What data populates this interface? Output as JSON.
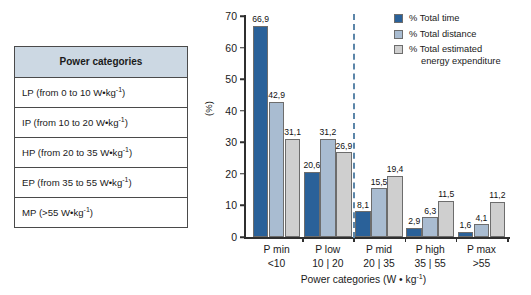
{
  "table": {
    "header": "Power categories",
    "rows": [
      {
        "label": "LP (from 0 to 10 W•kg",
        "sup": "-1",
        "tail": ")"
      },
      {
        "label": "IP (from 10 to 20 W•kg",
        "sup": "-1",
        "tail": ")"
      },
      {
        "label": "HP (from 20 to 35 W•kg",
        "sup": "-1",
        "tail": ")"
      },
      {
        "label": "EP (from 35 to 55 W•kg",
        "sup": "-1",
        "tail": ")"
      },
      {
        "label": "MP (>55 W•kg",
        "sup": "-1",
        "tail": ")"
      }
    ]
  },
  "legend": {
    "items": [
      {
        "label": "% Total time",
        "label2": "",
        "color": "#2a6199"
      },
      {
        "label": "% Total distance",
        "label2": "",
        "color": "#a9bcd1"
      },
      {
        "label": "% Total estimated",
        "label2": "energy expenditure",
        "color": "#cfcfcf"
      }
    ]
  },
  "chart_data": {
    "type": "bar",
    "title": "",
    "xlabel": "Power categories (W • kg",
    "xlabel_sup": "-1",
    "xlabel_tail": ")",
    "ylabel": "(%)",
    "ylim": [
      0,
      70
    ],
    "yticks": [
      0,
      10,
      20,
      30,
      40,
      50,
      60,
      70
    ],
    "ytick_labels": [
      "0",
      "10",
      "20",
      "30",
      "40",
      "50",
      "60",
      "70"
    ],
    "grid": false,
    "legend_position": "top-right",
    "categories": [
      "P min",
      "P low",
      "P mid",
      "P high",
      "P max"
    ],
    "category_sublabels": [
      "<10",
      "10 | 20",
      "20 | 35",
      "35 | 55",
      ">55"
    ],
    "series": [
      {
        "name": "% Total time",
        "color": "#2a6199",
        "values": [
          66.9,
          20.6,
          8.1,
          2.9,
          1.6
        ],
        "labels": [
          "66,9",
          "20,6",
          "8,1",
          "2,9",
          "1,6"
        ]
      },
      {
        "name": "% Total distance",
        "color": "#a9bcd1",
        "values": [
          42.9,
          31.2,
          15.5,
          6.3,
          4.1
        ],
        "labels": [
          "42,9",
          "31,2",
          "15,5",
          "6,3",
          "4,1"
        ]
      },
      {
        "name": "% Total estimated energy expenditure",
        "color": "#cfcfcf",
        "values": [
          31.1,
          26.9,
          19.4,
          11.5,
          11.2
        ],
        "labels": [
          "31,1",
          "26,9",
          "19,4",
          "11,5",
          "11,2"
        ]
      }
    ],
    "annotations": [
      {
        "type": "vertical-dashed-line",
        "after_category_index": 1,
        "color": "#5c86a9"
      }
    ]
  }
}
